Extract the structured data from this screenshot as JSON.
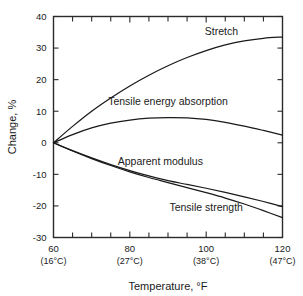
{
  "chart_data": {
    "type": "line",
    "title": "",
    "xlabel": "Temperature, °F",
    "ylabel": "Change, %",
    "xlim": [
      60,
      120
    ],
    "ylim": [
      -30,
      40
    ],
    "grid": false,
    "legend_position": "inline-annotations",
    "x_tick_labels": [
      "60",
      "80",
      "100",
      "120"
    ],
    "x_tick_sublabels": [
      "(16°C)",
      "(27°C)",
      "(38°C)",
      "(47°C)"
    ],
    "x_tick_values": [
      60,
      80,
      100,
      120
    ],
    "x_minor_tick_values": [
      65,
      70,
      75,
      85,
      90,
      95,
      105,
      110,
      115
    ],
    "y_tick_labels": [
      "40",
      "30",
      "20",
      "10",
      "0",
      "-10",
      "-20",
      "-30"
    ],
    "y_tick_values": [
      40,
      30,
      20,
      10,
      0,
      -10,
      -20,
      -30
    ],
    "x": [
      60,
      65,
      70,
      75,
      80,
      85,
      90,
      95,
      100,
      105,
      110,
      115,
      120
    ],
    "series": [
      {
        "name": "Stretch",
        "label": "Stretch",
        "values": [
          0,
          5.2,
          10.0,
          14.2,
          18.0,
          21.4,
          24.4,
          27.0,
          29.2,
          31.0,
          32.3,
          33.1,
          33.5
        ]
      },
      {
        "name": "Tensile energy absorption",
        "label": "Tensile energy absorption",
        "values": [
          0,
          2.6,
          4.7,
          6.2,
          7.2,
          7.8,
          8.0,
          7.9,
          7.4,
          6.5,
          5.3,
          3.9,
          2.4
        ]
      },
      {
        "name": "Apparent modulus",
        "label": "Apparent modulus",
        "values": [
          0,
          -2.5,
          -4.8,
          -6.9,
          -8.8,
          -10.5,
          -12.0,
          -13.2,
          -14.4,
          -15.7,
          -17.1,
          -18.6,
          -20.2
        ]
      },
      {
        "name": "Tensile strength",
        "label": "Tensile strength",
        "values": [
          0,
          -2.6,
          -5.0,
          -7.2,
          -9.2,
          -11.0,
          -12.6,
          -14.2,
          -15.8,
          -17.5,
          -19.4,
          -21.5,
          -23.7
        ]
      }
    ],
    "annotations": [
      {
        "text": "Stretch",
        "x": 104,
        "y": 34
      },
      {
        "text": "Tensile energy absorption",
        "x": 90,
        "y": 12
      },
      {
        "text": "Apparent modulus",
        "x": 88,
        "y": -7
      },
      {
        "text": "Tensile strength",
        "x": 100,
        "y": -21.5
      }
    ]
  }
}
